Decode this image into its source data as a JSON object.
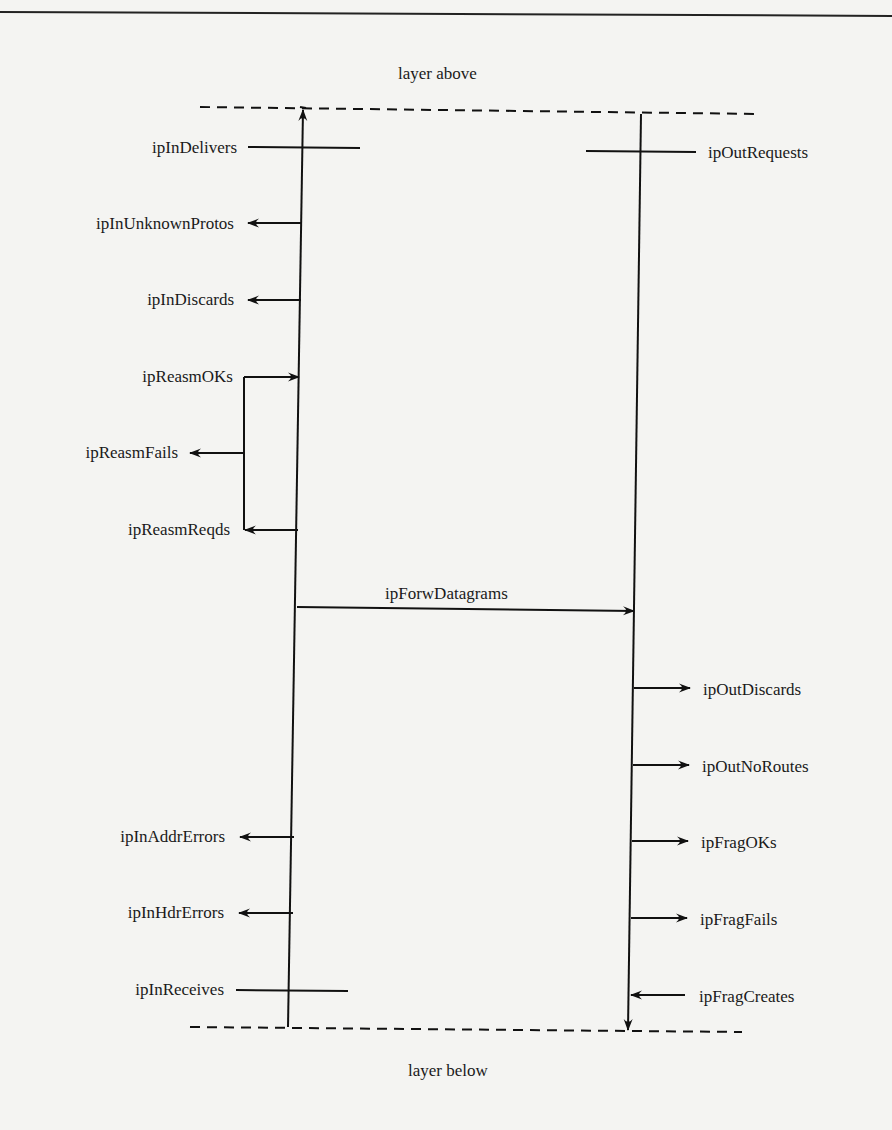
{
  "diagram": {
    "title_top": "layer above",
    "title_bottom": "layer below",
    "input_path": {
      "direction": "up",
      "counters": [
        {
          "label": "ipInDelivers",
          "kind": "crossing"
        },
        {
          "label": "ipInUnknownProtos",
          "kind": "out-left"
        },
        {
          "label": "ipInDiscards",
          "kind": "out-left"
        },
        {
          "label": "ipReasmOKs",
          "kind": "in-from-bracket"
        },
        {
          "label": "ipReasmFails",
          "kind": "out-left-from-bracket"
        },
        {
          "label": "ipReasmReqds",
          "kind": "out-left-to-bracket"
        },
        {
          "label": "ipInAddrErrors",
          "kind": "out-left"
        },
        {
          "label": "ipInHdrErrors",
          "kind": "out-left"
        },
        {
          "label": "ipInReceives",
          "kind": "crossing"
        }
      ]
    },
    "forward": {
      "label": "ipForwDatagrams",
      "kind": "left-to-right"
    },
    "output_path": {
      "direction": "down",
      "counters": [
        {
          "label": "ipOutRequests",
          "kind": "crossing"
        },
        {
          "label": "ipOutDiscards",
          "kind": "out-right"
        },
        {
          "label": "ipOutNoRoutes",
          "kind": "out-right"
        },
        {
          "label": "ipFragOKs",
          "kind": "out-right"
        },
        {
          "label": "ipFragFails",
          "kind": "out-right"
        },
        {
          "label": "ipFragCreates",
          "kind": "in-from-right"
        }
      ]
    }
  }
}
